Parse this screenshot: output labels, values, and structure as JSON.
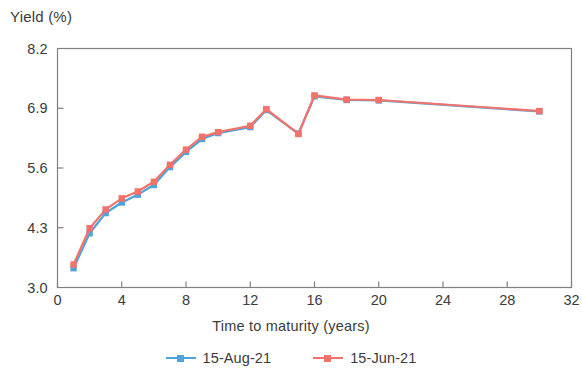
{
  "chart_data": {
    "type": "line",
    "title": "",
    "xlabel": "Time to maturity (years)",
    "ylabel": "Yield (%)",
    "xlim": [
      0,
      32
    ],
    "ylim": [
      3.0,
      8.2
    ],
    "xticks": [
      "0",
      "4",
      "8",
      "12",
      "16",
      "20",
      "24",
      "28",
      "32"
    ],
    "xtick_values": [
      0,
      4,
      8,
      12,
      16,
      20,
      24,
      28,
      32
    ],
    "yticks": [
      "3.0",
      "4.3",
      "5.6",
      "6.9",
      "8.2"
    ],
    "ytick_values": [
      3.0,
      4.3,
      5.6,
      6.9,
      8.2
    ],
    "grid": false,
    "legend_position": "bottom-center",
    "x": [
      1,
      2,
      3,
      4,
      5,
      6,
      7,
      8,
      9,
      10,
      12,
      13,
      15,
      16,
      18,
      20,
      30
    ],
    "series": [
      {
        "name": "15-Aug-21",
        "color": "#4FA3D9",
        "marker": "square",
        "values": [
          3.42,
          4.18,
          4.62,
          4.85,
          5.02,
          5.23,
          5.62,
          5.95,
          6.23,
          6.36,
          6.49,
          6.86,
          6.35,
          7.16,
          7.08,
          7.07,
          6.83
        ]
      },
      {
        "name": "15-Jun-21",
        "color": "#F4726A",
        "marker": "square",
        "values": [
          3.5,
          4.29,
          4.7,
          4.94,
          5.09,
          5.3,
          5.67,
          6.0,
          6.28,
          6.38,
          6.52,
          6.88,
          6.34,
          7.18,
          7.09,
          7.08,
          6.84
        ]
      }
    ]
  },
  "legend": {
    "entries": [
      {
        "label": "15-Aug-21"
      },
      {
        "label": "15-Jun-21"
      }
    ]
  },
  "axis": {
    "frame_color": "#808080",
    "background": "#ffffff"
  }
}
